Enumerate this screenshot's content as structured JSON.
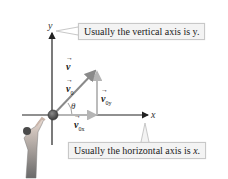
{
  "diagram": {
    "callouts": {
      "vertical": "Usually the vertical axis is y.",
      "horizontal_prefix": "Usually the horizontal axis is ",
      "horizontal_var": "x",
      "horizontal_suffix": "."
    },
    "axes": {
      "x_label": "x",
      "y_label": "y"
    },
    "vectors": {
      "v": {
        "symbol": "v",
        "sub": ""
      },
      "v0": {
        "symbol": "v",
        "sub": "0"
      },
      "v0x": {
        "symbol": "v",
        "sub": "0x"
      },
      "v0y": {
        "symbol": "v",
        "sub": "0y"
      }
    },
    "angle_label": "θ",
    "colors": {
      "axis": "#222222",
      "vector": "#8a8a8a",
      "component": "#b5b5b5",
      "callout_bg": "#f3f3f3",
      "callout_border": "#c8c8c8",
      "ball": "#5a5a5a"
    }
  }
}
